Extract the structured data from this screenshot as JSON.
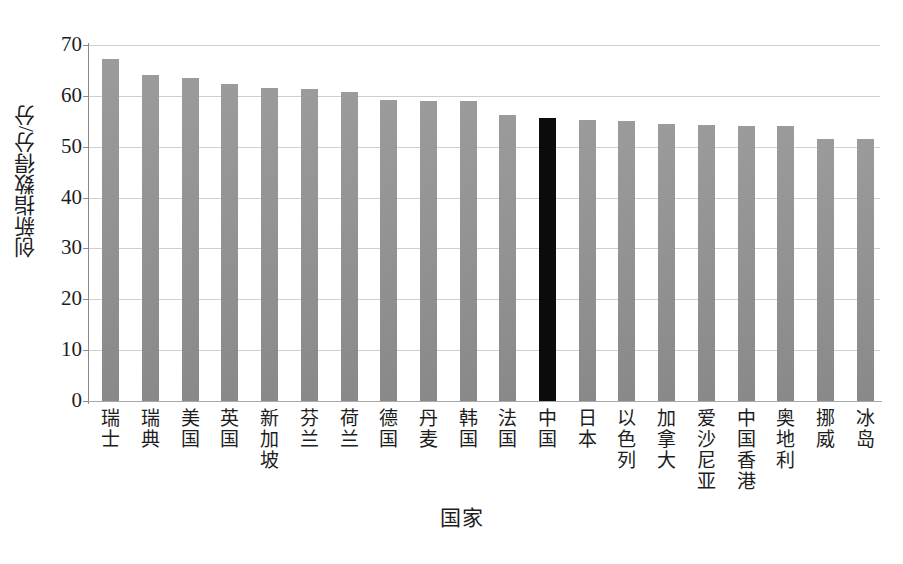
{
  "chart_data": {
    "type": "bar",
    "title": "",
    "xlabel": "国家",
    "ylabel": "创新指数得分/分",
    "ylim": [
      0,
      70
    ],
    "yticks": [
      0,
      10,
      20,
      30,
      40,
      50,
      60,
      70
    ],
    "ytick_labels": [
      "0",
      "10",
      "20",
      "30",
      "40",
      "50",
      "60",
      "70"
    ],
    "grid": true,
    "legend": "none",
    "bar_color": "#909090",
    "highlight_color": "#0b0b0b",
    "highlight_category": "中国",
    "categories": [
      "瑞士",
      "瑞典",
      "美国",
      "英国",
      "新加坡",
      "芬兰",
      "荷兰",
      "德国",
      "丹麦",
      "韩国",
      "法国",
      "中国",
      "日本",
      "以色列",
      "加拿大",
      "爱沙尼亚",
      "中国香港",
      "奥地利",
      "挪威",
      "冰岛"
    ],
    "values": [
      67.2,
      64.2,
      63.5,
      62.4,
      61.6,
      61.4,
      60.7,
      59.1,
      59.0,
      58.9,
      56.3,
      55.7,
      55.3,
      55.1,
      54.5,
      54.2,
      54.1,
      54.1,
      51.6,
      51.6
    ],
    "series": [
      {
        "name": "创新指数得分",
        "values": [
          67.2,
          64.2,
          63.5,
          62.4,
          61.6,
          61.4,
          60.7,
          59.1,
          59.0,
          58.9,
          56.3,
          55.7,
          55.3,
          55.1,
          54.5,
          54.2,
          54.1,
          54.1,
          51.6,
          51.6
        ]
      }
    ]
  }
}
